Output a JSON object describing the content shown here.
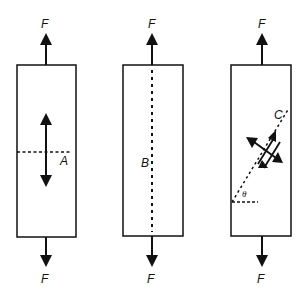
{
  "diagram": {
    "panels": [
      {
        "id": "left",
        "top_force": "F",
        "bottom_force": "F",
        "section_label": "A",
        "section": "transverse dashed line with double-headed arrow (normal stress)"
      },
      {
        "id": "middle",
        "top_force": "F",
        "bottom_force": "F",
        "section_label": "B",
        "section": "longitudinal dashed line"
      },
      {
        "id": "right",
        "top_force": "F",
        "bottom_force": "F",
        "section_label": "C",
        "angle_label": "θ",
        "section": "inclined dashed plane with normal and shear arrows"
      }
    ],
    "colors": {
      "ink": "#111111",
      "background": "#ffffff"
    }
  }
}
